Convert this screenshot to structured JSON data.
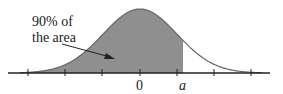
{
  "diagram": {
    "type": "normal distribution curve",
    "annotation_line1": "90% of",
    "annotation_line2": "the area",
    "tick_label_zero": "0",
    "tick_label_a": "a",
    "shaded_fraction": "90%",
    "colors": {
      "shade": "#8f8f8f",
      "curve": "#666666",
      "axis": "#222222"
    }
  }
}
